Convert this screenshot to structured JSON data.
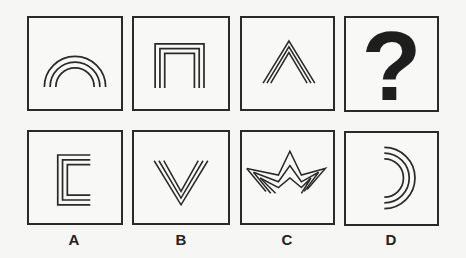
{
  "puzzle": {
    "question_row": [
      {
        "id": "q1",
        "shape": "triple-arch-icon"
      },
      {
        "id": "q2",
        "shape": "triple-square-arch-icon"
      },
      {
        "id": "q3",
        "shape": "triple-chevron-up-icon"
      },
      {
        "id": "q4",
        "shape": "question-mark",
        "text": "?"
      }
    ],
    "options": [
      {
        "label": "A",
        "shape": "triple-bracket-left-icon"
      },
      {
        "label": "B",
        "shape": "triple-chevron-down-icon"
      },
      {
        "label": "C",
        "shape": "triple-crown-star-icon"
      },
      {
        "label": "D",
        "shape": "triple-arc-right-icon"
      }
    ]
  },
  "colors": {
    "stroke": "#2a2a2a",
    "background": "#f6f6f4"
  }
}
